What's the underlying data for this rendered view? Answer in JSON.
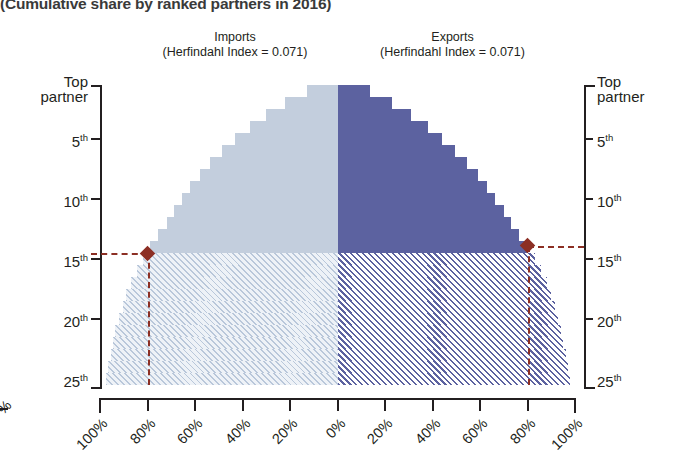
{
  "title": "(Cumulative share by ranked partners in 2016)",
  "panels": {
    "imports": {
      "name": "Imports",
      "index_label": "(Herfindahl Index = 0.071)"
    },
    "exports": {
      "name": "Exports",
      "index_label": "(Herfindahl Index = 0.071)"
    }
  },
  "axes": {
    "y_label_top": "Top",
    "y_label_top2": "partner",
    "y_ticks": [
      "Top partner",
      "5th",
      "10th",
      "15th",
      "20th",
      "25th"
    ],
    "y_tick_values": [
      1,
      5,
      10,
      15,
      20,
      25
    ],
    "y_superscript": "th",
    "x_ticks": [
      "100%",
      "80%",
      "60%",
      "40%",
      "20%",
      "0%",
      "20%",
      "40%",
      "60%",
      "80%",
      "100%"
    ],
    "x_tick_values": [
      -100,
      -80,
      -60,
      -40,
      -20,
      0,
      20,
      40,
      60,
      80,
      100
    ]
  },
  "colors": {
    "imports_solid": "#c3cedd",
    "exports_solid": "#5c62a0",
    "reference": "#8c2f24",
    "axis": "#231f20"
  },
  "annotations": {
    "imports_marker": {
      "rank": 14,
      "share": 80,
      "label": "80% at 14th partner"
    },
    "exports_marker": {
      "rank": 14,
      "share": 80,
      "label": "80% at 14th partner"
    },
    "solid_hatch_split_rank": 14
  },
  "bleed": {
    "left_fragment_label": "%"
  },
  "chart_data": {
    "type": "bar",
    "orientation": "horizontal-butterfly",
    "title": "(Cumulative share by ranked partners in 2016)",
    "xlabel": "",
    "ylabel": "",
    "xlim": [
      -100,
      100
    ],
    "ylim": [
      25.5,
      0.5
    ],
    "grid": false,
    "legend": "none",
    "categories": [
      "1",
      "2",
      "3",
      "4",
      "5",
      "6",
      "7",
      "8",
      "9",
      "10",
      "11",
      "12",
      "13",
      "14",
      "15",
      "16",
      "17",
      "18",
      "19",
      "20",
      "21",
      "22",
      "23",
      "24",
      "25"
    ],
    "series": [
      {
        "name": "Imports",
        "side": "left",
        "color": "#c3cedd",
        "herfindahl_index": 0.071,
        "units": "cumulative % share",
        "values": [
          13,
          22,
          30,
          37,
          43,
          48.5,
          53.5,
          58,
          62,
          65.5,
          69,
          72,
          75.5,
          79,
          82,
          84.5,
          87,
          89,
          90.5,
          92,
          93.5,
          94.5,
          95.5,
          96.5,
          97.5
        ]
      },
      {
        "name": "Exports",
        "side": "right",
        "color": "#5c62a0",
        "herfindahl_index": 0.071,
        "units": "cumulative % share",
        "values": [
          13.5,
          23,
          31,
          38,
          44,
          49.5,
          54.5,
          59,
          63,
          66.5,
          70,
          73,
          76.5,
          80,
          83,
          85.5,
          88,
          90,
          91.5,
          93,
          94,
          95,
          96,
          97,
          98
        ]
      }
    ],
    "annotations": [
      {
        "type": "reference",
        "axis": "y",
        "value": 14,
        "style": "dashed",
        "color": "#8c2f24"
      },
      {
        "type": "reference",
        "axis": "x",
        "value": -80,
        "style": "dashed",
        "color": "#8c2f24"
      },
      {
        "type": "reference",
        "axis": "x",
        "value": 80,
        "style": "dashed",
        "color": "#8c2f24"
      },
      {
        "type": "marker",
        "shape": "diamond",
        "x": -80,
        "y": 14,
        "color": "#8c2f24"
      },
      {
        "type": "marker",
        "shape": "diamond",
        "x": 80,
        "y": 14,
        "color": "#8c2f24"
      }
    ],
    "fill_note": "Bars for ranks 1-14 are solid; ranks 15-25 are drawn with diagonal hatching."
  }
}
